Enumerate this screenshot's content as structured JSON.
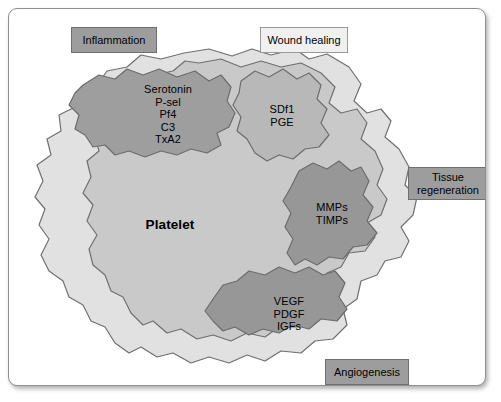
{
  "figure": {
    "subject": "Platelet",
    "center_label": "Platelet"
  },
  "function_labels": [
    {
      "id": "inflammation",
      "text": "Inflammation",
      "style": "dark"
    },
    {
      "id": "wound_healing",
      "text": "Wound healing",
      "style": "light"
    },
    {
      "id": "tissue_regeneration",
      "text": "Tissue\nregeneration",
      "style": "dark"
    },
    {
      "id": "angiogenesis",
      "text": "Angiogenesis",
      "style": "dark"
    }
  ],
  "granules": [
    {
      "id": "inflammation_granule",
      "molecules": [
        "Serotonin",
        "P-sel",
        "Pf4",
        "C3",
        "TxA2"
      ],
      "text": "Serotonin\nP-sel\nPf4\nC3\nTxA2"
    },
    {
      "id": "wound_healing_granule",
      "molecules": [
        "SDf1",
        "PGE"
      ],
      "text": "SDf1\nPGE"
    },
    {
      "id": "tissue_regeneration_granule",
      "molecules": [
        "MMPs",
        "TIMPs"
      ],
      "text": "MMPs\nTIMPs"
    },
    {
      "id": "angiogenesis_granule",
      "molecules": [
        "VEGF",
        "PDGF",
        "IGFs"
      ],
      "text": "VEGF\nPDGF\nIGFs"
    }
  ],
  "colors": {
    "panel_background": "#ffffff",
    "panel_border": "#8f8f8f",
    "cytoplasm": "#e0e0e0",
    "platelet_body": "#c8c8c8",
    "granule": "#9d9d9d",
    "outline": "#6f6f6f",
    "label_dark": "#9d9d9d",
    "label_light": "#f0f0f0",
    "text": "#000000"
  }
}
